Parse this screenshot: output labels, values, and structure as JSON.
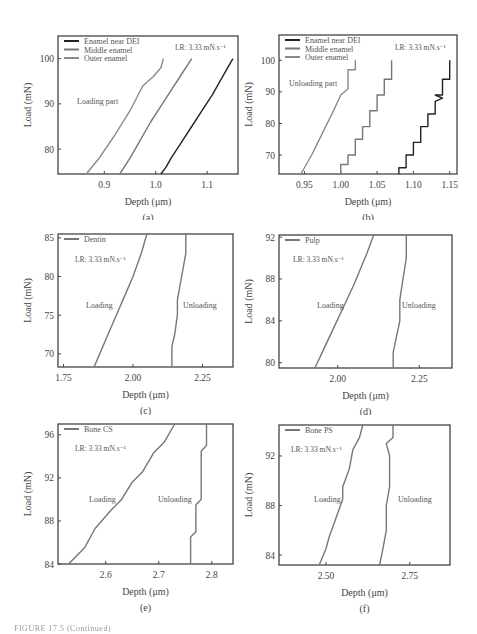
{
  "figure_caption": "FIGURE 17.5 (Continued)",
  "chart_data": [
    {
      "id": "a",
      "type": "line",
      "panel_label": "(a)",
      "xlabel": "Depth (μm)",
      "ylabel": "Load (mN)",
      "xlim": [
        0.81,
        1.16
      ],
      "ylim": [
        74.5,
        105
      ],
      "xticks": [
        0.9,
        1.0,
        1.1
      ],
      "xtick_labels": [
        "0.9",
        "1.0",
        "1.1"
      ],
      "yticks": [
        80,
        90,
        100
      ],
      "ytick_labels": [
        "80",
        "90",
        "100"
      ],
      "annotation": "LR: 3.33 mN.s⁻¹",
      "text_label": "Loading part",
      "legend": [
        "Enamel near DEI",
        "Middle enamel",
        "Outer enamel"
      ],
      "series": [
        {
          "name": "Enamel near DEI",
          "color": "#222222",
          "x": [
            1.01,
            1.02,
            1.03,
            1.05,
            1.07,
            1.09,
            1.11,
            1.13,
            1.15
          ],
          "y": [
            74.5,
            76,
            78,
            81.5,
            85,
            88.5,
            92,
            96,
            100
          ]
        },
        {
          "name": "Middle enamel",
          "color": "#777777",
          "x": [
            0.93,
            0.95,
            0.97,
            0.99,
            1.01,
            1.03,
            1.05,
            1.07
          ],
          "y": [
            74.5,
            78,
            82,
            86,
            89.5,
            93,
            96.5,
            100
          ]
        },
        {
          "name": "Outer enamel",
          "color": "#8a8a8a",
          "x": [
            0.865,
            0.89,
            0.92,
            0.95,
            0.975,
            0.995,
            1.01,
            1.015
          ],
          "y": [
            74.5,
            78,
            83,
            88.5,
            94,
            96,
            98,
            100
          ]
        }
      ]
    },
    {
      "id": "b",
      "type": "line",
      "panel_label": "(b)",
      "xlabel": "Depth (μm)",
      "ylabel": "Load (mN)",
      "xlim": [
        0.915,
        1.16
      ],
      "ylim": [
        64,
        108
      ],
      "xticks": [
        0.95,
        1.0,
        1.05,
        1.1,
        1.15
      ],
      "xtick_labels": [
        "0.95",
        "1.00",
        "1.05",
        "1.10",
        "1.15"
      ],
      "yticks": [
        70,
        80,
        90,
        100
      ],
      "ytick_labels": [
        "70",
        "80",
        "90",
        "100"
      ],
      "annotation": "LR: 3.33 mN.s⁻¹",
      "text_label": "Unloading part",
      "legend": [
        "Enamel near DEI",
        "Middle enamel",
        "Outer enamel"
      ],
      "series": [
        {
          "name": "Enamel near DEI",
          "color": "#222222",
          "x": [
            1.08,
            1.08,
            1.09,
            1.09,
            1.1,
            1.1,
            1.11,
            1.11,
            1.12,
            1.12,
            1.13,
            1.13,
            1.14,
            1.13,
            1.14,
            1.14,
            1.15,
            1.15
          ],
          "y": [
            64,
            66,
            66,
            70,
            70,
            74,
            74,
            79,
            79,
            83,
            83,
            87,
            88,
            89,
            89,
            94,
            94,
            100
          ]
        },
        {
          "name": "Middle enamel",
          "color": "#777777",
          "x": [
            1.0,
            1.0,
            1.01,
            1.01,
            1.02,
            1.02,
            1.03,
            1.03,
            1.04,
            1.04,
            1.05,
            1.05,
            1.06,
            1.06,
            1.07,
            1.07
          ],
          "y": [
            64,
            67,
            67,
            70,
            70,
            75,
            75,
            79,
            79,
            84,
            84,
            89,
            89,
            94,
            94,
            100
          ]
        },
        {
          "name": "Outer enamel",
          "color": "#8a8a8a",
          "x": [
            0.945,
            0.96,
            0.975,
            0.99,
            1.0,
            1.01,
            1.01,
            1.02,
            1.02
          ],
          "y": [
            64,
            70,
            77,
            84,
            89,
            91,
            97,
            97,
            100
          ]
        }
      ]
    },
    {
      "id": "c",
      "type": "line",
      "panel_label": "(c)",
      "xlabel": "Depth (μm)",
      "ylabel": "Load (mN)",
      "xlim": [
        1.73,
        2.36
      ],
      "ylim": [
        68.3,
        85.5
      ],
      "xticks": [
        1.75,
        2.0,
        2.25
      ],
      "xtick_labels": [
        "1.75",
        "2.00",
        "2.25"
      ],
      "yticks": [
        70,
        75,
        80,
        85
      ],
      "ytick_labels": [
        "70",
        "75",
        "80",
        "85"
      ],
      "annotation": "LR: 3.33 mN.s⁻¹",
      "legend": [
        "Dentin"
      ],
      "labels": [
        "Loading",
        "Unloading"
      ],
      "series": [
        {
          "name": "Loading",
          "color": "#777777",
          "x": [
            1.86,
            1.88,
            1.91,
            1.94,
            1.97,
            2.0,
            2.03,
            2.05
          ],
          "y": [
            68.3,
            70,
            72.5,
            75,
            77.5,
            80,
            83,
            85.5
          ]
        },
        {
          "name": "Unloading",
          "color": "#777777",
          "x": [
            2.14,
            2.14,
            2.15,
            2.16,
            2.16,
            2.17,
            2.18,
            2.19,
            2.19
          ],
          "y": [
            68.3,
            71,
            72.5,
            75,
            77,
            79,
            81,
            83,
            85.5
          ]
        }
      ]
    },
    {
      "id": "d",
      "type": "line",
      "panel_label": "(d)",
      "xlabel": "Depth (μm)",
      "ylabel": "Load (mN)",
      "xlim": [
        1.82,
        2.35
      ],
      "ylim": [
        79.5,
        92.2
      ],
      "xticks": [
        2.0,
        2.25
      ],
      "xtick_labels": [
        "2.00",
        "2.25"
      ],
      "yticks": [
        80,
        84,
        88,
        92
      ],
      "ytick_labels": [
        "80",
        "84",
        "88",
        "92"
      ],
      "annotation": "LR: 3.33 mN.s⁻¹",
      "legend": [
        "Pulp"
      ],
      "labels": [
        "Loading",
        "Unloading"
      ],
      "series": [
        {
          "name": "Loading",
          "color": "#777777",
          "x": [
            1.93,
            1.96,
            1.99,
            2.02,
            2.05,
            2.07,
            2.09,
            2.11
          ],
          "y": [
            79.5,
            81.5,
            83.5,
            85.5,
            87.5,
            89,
            90.5,
            92.2
          ]
        },
        {
          "name": "Unloading",
          "color": "#777777",
          "x": [
            2.17,
            2.17,
            2.18,
            2.19,
            2.19,
            2.2,
            2.21,
            2.21
          ],
          "y": [
            79.5,
            81,
            82.5,
            84,
            86,
            88,
            90,
            92.2
          ]
        }
      ]
    },
    {
      "id": "e",
      "type": "line",
      "panel_label": "(e)",
      "xlabel": "Depth (μm)",
      "ylabel": "Load (mN)",
      "xlim": [
        2.51,
        2.84
      ],
      "ylim": [
        84,
        97
      ],
      "xticks": [
        2.6,
        2.7,
        2.8
      ],
      "xtick_labels": [
        "2.6",
        "2.7",
        "2.8"
      ],
      "yticks": [
        84,
        88,
        92,
        96
      ],
      "ytick_labels": [
        "84",
        "88",
        "92",
        "96"
      ],
      "annotation": "LR: 3.33 mN.s⁻¹",
      "legend": [
        "Bone CS"
      ],
      "labels": [
        "Loading",
        "Unloading"
      ],
      "series": [
        {
          "name": "Loading",
          "color": "#777777",
          "x": [
            2.53,
            2.56,
            2.58,
            2.61,
            2.63,
            2.65,
            2.67,
            2.69,
            2.71,
            2.73
          ],
          "y": [
            84,
            85.5,
            87.3,
            89,
            90,
            91.6,
            92.6,
            94.3,
            95.3,
            97
          ]
        },
        {
          "name": "Unloading",
          "color": "#777777",
          "x": [
            2.76,
            2.76,
            2.77,
            2.77,
            2.78,
            2.78,
            2.79,
            2.79
          ],
          "y": [
            84,
            86.5,
            87,
            89.5,
            90,
            94.5,
            95,
            97
          ]
        }
      ]
    },
    {
      "id": "f",
      "type": "line",
      "panel_label": "(f)",
      "xlabel": "Depth (μm)",
      "ylabel": "Load (mN)",
      "xlim": [
        2.36,
        2.87
      ],
      "ylim": [
        83.2,
        94.5
      ],
      "xticks": [
        2.5,
        2.75
      ],
      "xtick_labels": [
        "2.50",
        "2.75"
      ],
      "yticks": [
        84,
        88,
        92
      ],
      "ytick_labels": [
        "84",
        "88",
        "92"
      ],
      "annotation": "LR: 3.33 mN.s⁻¹",
      "legend": [
        "Bone PS"
      ],
      "labels": [
        "Loading",
        "Unloading"
      ],
      "series": [
        {
          "name": "Loading",
          "color": "#777777",
          "x": [
            2.48,
            2.5,
            2.51,
            2.53,
            2.55,
            2.55,
            2.57,
            2.58,
            2.6,
            2.61
          ],
          "y": [
            83.2,
            84.5,
            85.5,
            87,
            88.5,
            89.5,
            91,
            92.5,
            93.5,
            94.5
          ]
        },
        {
          "name": "Unloading",
          "color": "#777777",
          "x": [
            2.66,
            2.67,
            2.68,
            2.68,
            2.69,
            2.69,
            2.68,
            2.7,
            2.7
          ],
          "y": [
            83.2,
            84.5,
            86,
            88,
            89.5,
            92,
            93,
            93.5,
            94.5
          ]
        }
      ]
    }
  ]
}
